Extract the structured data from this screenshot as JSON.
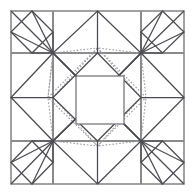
{
  "document": {
    "kind": "geometric-line-diagram",
    "title": "Square crease pattern",
    "background_color": "#ffffff",
    "width": 195,
    "height": 195
  },
  "canvas": {
    "name": "pattern-canvas",
    "width": 195,
    "height": 195
  },
  "geometry": {
    "outer_square": {
      "x0": 11,
      "y0": 11,
      "x1": 184,
      "y1": 184
    },
    "grid_x": [
      11,
      53,
      141,
      184
    ],
    "grid_y": [
      11,
      53,
      141,
      184
    ],
    "center_square": {
      "x0": 76,
      "y0": 76,
      "x1": 124,
      "y1": 124
    },
    "midpoints": {
      "top": [
        97.5,
        11
      ],
      "bottom": [
        97.5,
        184
      ],
      "left": [
        11,
        97.5
      ],
      "right": [
        184,
        97.5
      ]
    },
    "cell_midpoints_outer": [
      32,
      97.5,
      162.5
    ],
    "inner_diamond_solid": [
      [
        97.5,
        53
      ],
      [
        141,
        97.5
      ],
      [
        97.5,
        141
      ],
      [
        53,
        97.5
      ]
    ],
    "inner_diamond_dotted": [
      [
        97.5,
        48
      ],
      [
        146,
        97.5
      ],
      [
        97.5,
        146
      ],
      [
        48,
        97.5
      ]
    ]
  },
  "styles": {
    "frame_color": "#8a8a8a",
    "frame_width": 1.6,
    "grid_color": "#8a8a8a",
    "grid_width": 1.1,
    "solid_color": "#4a4a52",
    "solid_width": 1.25,
    "dotted_color": "#9a9aa2",
    "dotted_width": 1.1,
    "dotted_dash": "1.6 1.8",
    "center_square_color": "#6b6b73",
    "center_square_width": 1.2
  },
  "layers": [
    {
      "id": "frame",
      "label": "Outer frame",
      "visible": true
    },
    {
      "id": "grid",
      "label": "Grid lines",
      "visible": true
    },
    {
      "id": "corner-diamonds",
      "label": "Corner diamonds",
      "visible": true
    },
    {
      "id": "edge-diamonds",
      "label": "Edge diamonds",
      "visible": true
    },
    {
      "id": "solid-creases",
      "label": "Solid creases",
      "visible": true
    },
    {
      "id": "dotted-creases",
      "label": "Dotted creases",
      "visible": true
    },
    {
      "id": "center-square",
      "label": "Center square",
      "visible": true
    }
  ],
  "annotations": {
    "caption": ""
  }
}
